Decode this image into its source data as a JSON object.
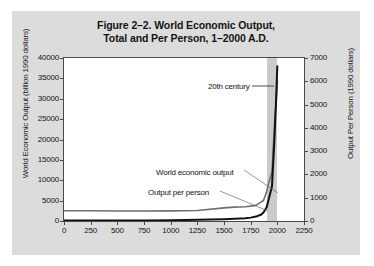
{
  "figure": {
    "title_line1": "Figure 2–2. World Economic Output,",
    "title_line2": "Total and Per Person, 1–2000 A.D."
  },
  "annotations": {
    "century": "20th century",
    "total_curve": "World economic output",
    "percap_curve": "Output per person"
  },
  "chart_data": {
    "type": "line",
    "title": "Figure 2–2. World Economic Output, Total and Per Person, 1–2000 A.D.",
    "xlabel": "",
    "xlim": [
      0,
      2250
    ],
    "xticks": [
      0,
      250,
      500,
      750,
      1000,
      1250,
      1500,
      1750,
      2000,
      2250
    ],
    "grid": false,
    "legend": "inline annotations",
    "axes": [
      {
        "side": "left",
        "label": "World Economic Output (billion 1990 dollars)",
        "ylim": [
          0,
          40000
        ],
        "yticks": [
          0,
          5000,
          10000,
          15000,
          20000,
          25000,
          30000,
          35000,
          40000
        ]
      },
      {
        "side": "right",
        "label": "Output Per Person (1990 dollars)",
        "ylim": [
          0,
          7000
        ],
        "yticks": [
          0,
          1000,
          2000,
          3000,
          4000,
          5000,
          6000,
          7000
        ]
      }
    ],
    "shaded_region": {
      "label": "20th century",
      "x_start": 1900,
      "x_end": 2000,
      "color": "#c2c2c2"
    },
    "series": [
      {
        "name": "World economic output",
        "axis": "left",
        "units": "billion 1990 dollars",
        "color": "#111111",
        "x": [
          1,
          250,
          500,
          750,
          1000,
          1250,
          1500,
          1600,
          1700,
          1750,
          1800,
          1850,
          1870,
          1900,
          1913,
          1950,
          1973,
          1990,
          2000
        ],
        "values": [
          100,
          110,
          120,
          140,
          180,
          280,
          430,
          540,
          680,
          830,
          1080,
          1600,
          2100,
          3400,
          4700,
          8500,
          20000,
          31000,
          38000
        ]
      },
      {
        "name": "Output per person",
        "axis": "right",
        "units": "1990 dollars",
        "color": "#6e6e6e",
        "x": [
          1,
          250,
          500,
          750,
          1000,
          1250,
          1500,
          1600,
          1700,
          1750,
          1800,
          1850,
          1870,
          1900,
          1913,
          1950,
          1973,
          1990,
          2000
        ],
        "values": [
          440,
          440,
          430,
          430,
          435,
          450,
          565,
          595,
          615,
          640,
          670,
          820,
          880,
          1260,
          1530,
          2110,
          4090,
          5150,
          6000
        ]
      }
    ]
  },
  "x_ticks": [
    "0",
    "250",
    "500",
    "750",
    "1000",
    "1250",
    "1500",
    "1750",
    "2000",
    "2250"
  ],
  "y_left_ticks": [
    "40000",
    "35000",
    "30000",
    "25000",
    "20000",
    "15000",
    "10000",
    "5000",
    "0"
  ],
  "y_right_ticks": [
    "7000",
    "6000",
    "5000",
    "4000",
    "3000",
    "2000",
    "1000",
    "0"
  ],
  "axis_titles": {
    "left": "World Economic Output (billion 1990 dollars)",
    "right": "Output Per Person (1990 dollars)"
  }
}
